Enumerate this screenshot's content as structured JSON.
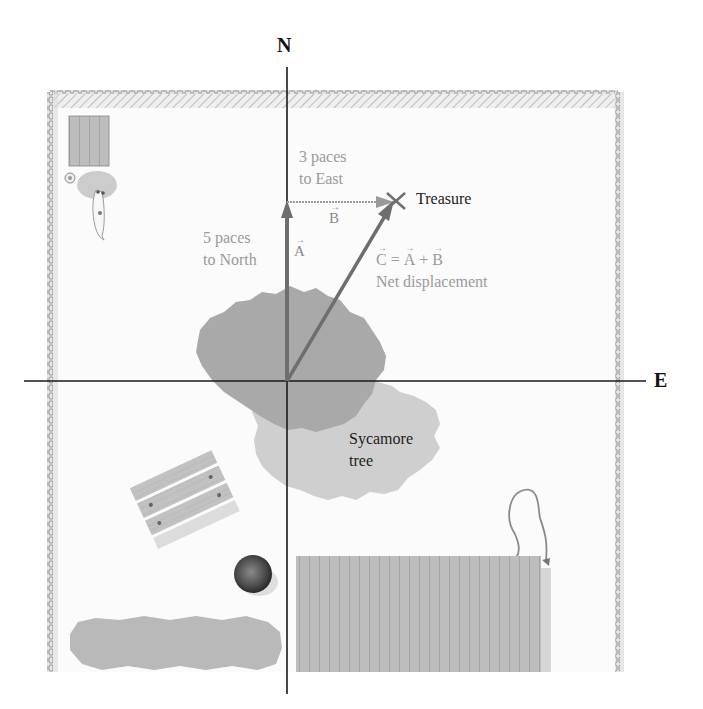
{
  "axes": {
    "north_label": "N",
    "east_label": "E"
  },
  "vectors": {
    "A": {
      "symbol": "A",
      "description_line1": "5 paces",
      "description_line2": "to North",
      "paces": 5,
      "direction": "North"
    },
    "B": {
      "symbol": "B",
      "description_line1": "3 paces",
      "description_line2": "to East",
      "paces": 3,
      "direction": "East"
    },
    "C": {
      "equation_c": "C",
      "equation_eq": "=",
      "equation_a": "A",
      "equation_plus": "+",
      "equation_b": "B",
      "description": "Net displacement"
    }
  },
  "landmarks": {
    "treasure": "Treasure",
    "tree_line1": "Sycamore",
    "tree_line2": "tree"
  },
  "colors": {
    "axis": "#1a1a1a",
    "vector": "#6e6e6e",
    "vector_label": "#9a9a9a",
    "tree_dark": "#a9a9a9",
    "tree_light": "#cfcfcf",
    "border": "#9c9c9c"
  }
}
